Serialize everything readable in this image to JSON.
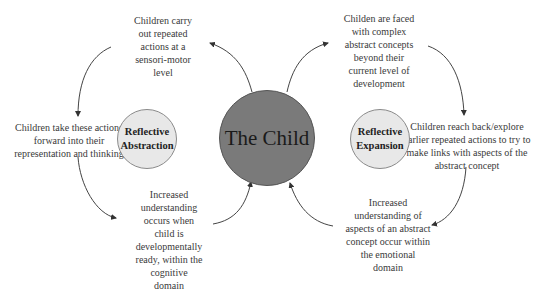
{
  "center": {
    "label": "The Child",
    "fill": "#7a7a7a"
  },
  "left_circle": {
    "line1": "Reflective",
    "line2": "Abstraction",
    "fill": "#e8e8e8"
  },
  "right_circle": {
    "line1": "Reflective",
    "line2": "Expansion",
    "fill": "#e8e8e8"
  },
  "left_cycle": {
    "top": [
      "Children carry",
      "out repeated",
      "actions at a",
      "sensori-motor",
      "level"
    ],
    "left": [
      "Children take these actions",
      "forward into their",
      "representation and thinking"
    ],
    "bottom": [
      "Increased",
      "understanding",
      "occurs when",
      "child is",
      "developmentally",
      "ready, within the",
      "cognitive",
      "domain"
    ]
  },
  "right_cycle": {
    "top": [
      "Childen are faced",
      "with complex",
      "abstract concepts",
      "beyond their",
      "current level of",
      "development"
    ],
    "right": [
      "Children reach back/explore",
      "earlier repeated actions to try to",
      "make links with aspects of the",
      "abstract concept"
    ],
    "bottom": [
      "Increased",
      "understanding of",
      "aspects of an abstract",
      "concept occur within",
      "the emotional",
      "domain"
    ]
  }
}
